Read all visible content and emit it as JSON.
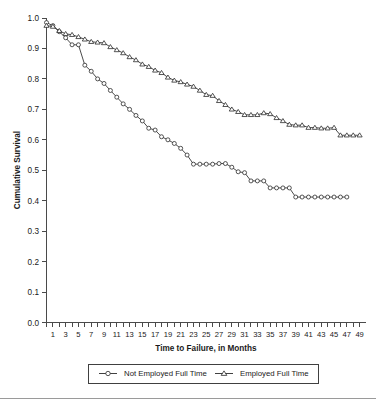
{
  "chart_data": {
    "type": "line",
    "title": "",
    "xlabel": "Time to Failure, in Months",
    "ylabel": "Cumulative Survival",
    "xlim": [
      0,
      50
    ],
    "ylim": [
      0.0,
      1.0
    ],
    "grid": false,
    "legend_position": "bottom",
    "y_ticks": [
      "0.0",
      "0.1",
      "0.2",
      "0.3",
      "0.4",
      "0.5",
      "0.6",
      "0.7",
      "0.8",
      "0.9",
      "1.0"
    ],
    "y_tick_values": [
      0.0,
      0.1,
      0.2,
      0.3,
      0.4,
      0.5,
      0.6,
      0.7,
      0.8,
      0.9,
      1.0
    ],
    "x_tick_labels": [
      "1",
      "3",
      "5",
      "7",
      "9",
      "11",
      "13",
      "15",
      "17",
      "19",
      "21",
      "23",
      "25",
      "27",
      "29",
      "31",
      "33",
      "35",
      "37",
      "39",
      "41",
      "43",
      "45",
      "47",
      "49"
    ],
    "x_tick_values": [
      1,
      3,
      5,
      7,
      9,
      11,
      13,
      15,
      17,
      19,
      21,
      23,
      25,
      27,
      29,
      31,
      33,
      35,
      37,
      39,
      41,
      43,
      45,
      47,
      49
    ],
    "x_minor_ticks": [
      0,
      1,
      2,
      3,
      4,
      5,
      6,
      7,
      8,
      9,
      10,
      11,
      12,
      13,
      14,
      15,
      16,
      17,
      18,
      19,
      20,
      21,
      22,
      23,
      24,
      25,
      26,
      27,
      28,
      29,
      30,
      31,
      32,
      33,
      34,
      35,
      36,
      37,
      38,
      39,
      40,
      41,
      42,
      43,
      44,
      45,
      46,
      47,
      48,
      49
    ],
    "series": [
      {
        "name": "Not Employed Full Time",
        "marker": "circle",
        "color": "#2b2b2b",
        "x": [
          0,
          1,
          2,
          3,
          4,
          5,
          6,
          7,
          8,
          9,
          10,
          11,
          12,
          13,
          14,
          15,
          16,
          17,
          18,
          19,
          20,
          21,
          22,
          23,
          24,
          25,
          26,
          27,
          28,
          29,
          30,
          31,
          32,
          33,
          34,
          35,
          36,
          37,
          38,
          39,
          40,
          41,
          42,
          43,
          44,
          45,
          46,
          47
        ],
        "values": [
          0.985,
          0.975,
          0.955,
          0.935,
          0.912,
          0.912,
          0.845,
          0.825,
          0.8,
          0.785,
          0.762,
          0.74,
          0.718,
          0.7,
          0.68,
          0.662,
          0.638,
          0.632,
          0.61,
          0.6,
          0.588,
          0.572,
          0.55,
          0.52,
          0.52,
          0.52,
          0.52,
          0.522,
          0.522,
          0.51,
          0.495,
          0.492,
          0.465,
          0.465,
          0.465,
          0.442,
          0.442,
          0.442,
          0.442,
          0.412,
          0.412,
          0.412,
          0.412,
          0.412,
          0.412,
          0.412,
          0.412,
          0.412
        ]
      },
      {
        "name": "Employed Full Time",
        "marker": "triangle",
        "color": "#2b2b2b",
        "x": [
          0,
          1,
          2,
          3,
          4,
          5,
          6,
          7,
          8,
          9,
          10,
          11,
          12,
          13,
          14,
          15,
          16,
          17,
          18,
          19,
          20,
          21,
          22,
          23,
          24,
          25,
          26,
          27,
          28,
          29,
          30,
          31,
          32,
          33,
          34,
          35,
          36,
          37,
          38,
          39,
          40,
          41,
          42,
          43,
          44,
          45,
          46,
          47,
          48,
          49
        ],
        "values": [
          0.975,
          0.972,
          0.958,
          0.948,
          0.945,
          0.938,
          0.93,
          0.922,
          0.92,
          0.918,
          0.905,
          0.895,
          0.885,
          0.872,
          0.862,
          0.848,
          0.84,
          0.828,
          0.82,
          0.805,
          0.795,
          0.79,
          0.782,
          0.775,
          0.762,
          0.748,
          0.745,
          0.728,
          0.715,
          0.7,
          0.692,
          0.682,
          0.682,
          0.682,
          0.688,
          0.685,
          0.672,
          0.662,
          0.65,
          0.648,
          0.648,
          0.64,
          0.64,
          0.638,
          0.638,
          0.64,
          0.615,
          0.615,
          0.615,
          0.615
        ]
      }
    ]
  },
  "legend": {
    "items": [
      {
        "label": "Not Employed Full Time",
        "marker": "circle"
      },
      {
        "label": "Employed Full Time",
        "marker": "triangle"
      }
    ]
  },
  "axes": {
    "y_title": "Cumulative Survival",
    "x_title": "Time to Failure, in Months"
  }
}
